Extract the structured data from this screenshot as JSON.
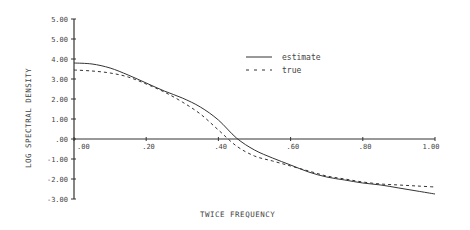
{
  "chart_data": {
    "type": "line",
    "title": "",
    "xlabel": "TWICE FREQUENCY",
    "ylabel": "LOG SPECTRAL DENSITY",
    "xlim": [
      0.0,
      1.0
    ],
    "ylim": [
      -3.0,
      5.0
    ],
    "x_tick_labels": [
      ".00",
      ".20",
      ".40",
      ".60",
      ".80",
      "1.00"
    ],
    "x_ticks": [
      0.0,
      0.2,
      0.4,
      0.6,
      0.8,
      1.0
    ],
    "y_tick_labels": [
      "5.00",
      "5.00",
      "4.00",
      "3.00",
      "2.00",
      "1.00",
      ".00",
      "-1.00",
      "-2.00",
      "-3.00"
    ],
    "y_ticks": [
      6.0,
      5.0,
      4.0,
      3.0,
      2.0,
      1.0,
      0.0,
      -1.0,
      -2.0,
      -3.0
    ],
    "grid": false,
    "legend_position": "upper right",
    "x": [
      0.0,
      0.05,
      0.1,
      0.15,
      0.2,
      0.25,
      0.3,
      0.35,
      0.4,
      0.45,
      0.5,
      0.55,
      0.6,
      0.65,
      0.7,
      0.75,
      0.8,
      0.85,
      0.9,
      0.95,
      1.0
    ],
    "series": [
      {
        "name": "estimate",
        "style": "solid",
        "values": [
          3.8,
          3.75,
          3.55,
          3.2,
          2.8,
          2.4,
          2.05,
          1.6,
          0.95,
          0.05,
          -0.55,
          -0.95,
          -1.3,
          -1.65,
          -1.9,
          -2.05,
          -2.2,
          -2.3,
          -2.45,
          -2.6,
          -2.75
        ]
      },
      {
        "name": "true",
        "style": "dashed",
        "values": [
          3.45,
          3.4,
          3.3,
          3.1,
          2.75,
          2.35,
          1.85,
          1.25,
          0.45,
          -0.35,
          -0.85,
          -1.1,
          -1.35,
          -1.6,
          -1.85,
          -2.0,
          -2.15,
          -2.25,
          -2.3,
          -2.35,
          -2.4
        ]
      }
    ]
  },
  "legend": {
    "estimate_label": "estimate",
    "true_label": "true"
  },
  "axes": {
    "xlabel": "TWICE FREQUENCY",
    "ylabel": "LOG SPECTRAL DENSITY"
  }
}
